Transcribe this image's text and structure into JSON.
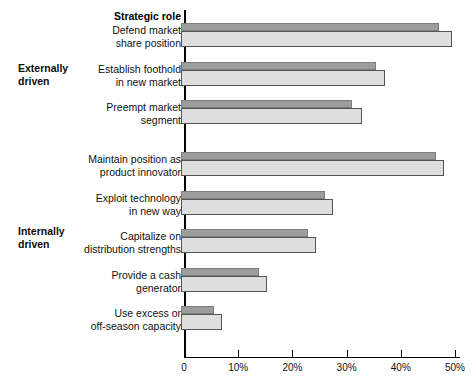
{
  "chart_data": {
    "type": "bar",
    "orientation": "horizontal",
    "title": "Strategic role",
    "xlabel": "",
    "ylabel": "",
    "xlim": [
      0,
      50
    ],
    "grid": false,
    "legend": "none",
    "xticks": [
      "0",
      "10%",
      "20%",
      "30%",
      "40%",
      "50%"
    ],
    "xtick_values": [
      0,
      10,
      20,
      30,
      40,
      50
    ],
    "categories": [
      "Defend market\nshare position",
      "Establish foothold\nin new market",
      "Preempt market\nsegment",
      "Maintain position as\nproduct innovator",
      "Exploit technology\nin new way",
      "Capitalize on\ndistribution strengths",
      "Provide a cash\ngenerator",
      "Use excess or\noff-season capacity"
    ],
    "series": [
      {
        "name": "dark",
        "values": [
          47,
          35.5,
          31,
          46.5,
          26,
          22.8,
          13.8,
          5.5
        ]
      },
      {
        "name": "light",
        "values": [
          49.5,
          37,
          32.8,
          48,
          27.5,
          24.3,
          15.4,
          7.1
        ]
      }
    ],
    "groups": [
      {
        "label": "Externally\ndriven",
        "categories": [
          0,
          1,
          2
        ]
      },
      {
        "label": "Internally\ndriven",
        "categories": [
          3,
          4,
          5,
          6,
          7
        ]
      }
    ],
    "colors": {
      "dark_bar": "#9d9d9d",
      "dark_bar_border": "#7d7d7d",
      "light_bar": "#dedede",
      "light_bar_border": "#555555",
      "axis": "#000000",
      "text": "#111111"
    }
  },
  "layout": {
    "axis_x_px": 184,
    "bar_left_px": 181,
    "px_per_percent": 5.42,
    "category_tops": [
      23,
      62,
      100,
      152,
      191,
      229,
      268,
      306
    ],
    "dark_bar_height": 8,
    "light_bar_height": 16,
    "group_label_tops": [
      62,
      225
    ]
  }
}
